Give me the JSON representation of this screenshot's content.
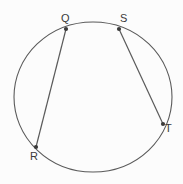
{
  "figure": {
    "name": "circle-with-two-chords",
    "background_color": "#fcfcfc",
    "stroke_color": "#5a5a5a",
    "label_color": "#3a3a3a",
    "circle": {
      "cx": 93,
      "cy": 97,
      "rx": 79,
      "ry": 75
    },
    "points": [
      {
        "id": "Q",
        "label": "Q",
        "x": 66,
        "y": 29,
        "label_x": 61,
        "label_y": 13
      },
      {
        "id": "S",
        "label": "S",
        "x": 119,
        "y": 29,
        "label_x": 120,
        "label_y": 13
      },
      {
        "id": "T",
        "label": "T",
        "x": 163,
        "y": 124,
        "label_x": 165,
        "label_y": 123
      },
      {
        "id": "R",
        "label": "R",
        "x": 36,
        "y": 147,
        "label_x": 30,
        "label_y": 151
      }
    ],
    "chords": [
      {
        "id": "QR",
        "from": "Q",
        "to": "R",
        "x1": 66,
        "y1": 29,
        "x2": 36,
        "y2": 147
      },
      {
        "id": "ST",
        "from": "S",
        "to": "T",
        "x1": 119,
        "y1": 29,
        "x2": 163,
        "y2": 124
      }
    ]
  }
}
